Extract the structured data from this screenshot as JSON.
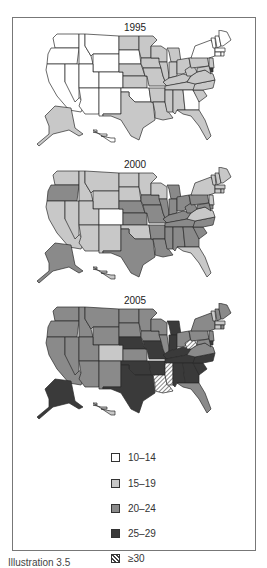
{
  "figure": {
    "caption": "Illustration 3.5"
  },
  "colors": {
    "c10_14": "#ffffff",
    "c15_19": "#c8c8c8",
    "c20_24": "#8a8a8a",
    "c25_29": "#3a3a3a",
    "border": "#2a2a2a"
  },
  "chart_data": {
    "type": "choropleth",
    "title": "",
    "legend_position": "bottom",
    "legend": [
      {
        "label": "10–14",
        "class": "c10_14"
      },
      {
        "label": "15–19",
        "class": "c15_19"
      },
      {
        "label": "20–24",
        "class": "c20_24"
      },
      {
        "label": "25–29",
        "class": "c25_29"
      },
      {
        "label": "≥30",
        "class": "c30"
      }
    ],
    "maps": [
      {
        "year": "1995",
        "states": {
          "WA": "c10_14",
          "OR": "c10_14",
          "CA": "c10_14",
          "NV": "c10_14",
          "ID": "c10_14",
          "MT": "c10_14",
          "WY": "c10_14",
          "UT": "c10_14",
          "CO": "c10_14",
          "AZ": "c10_14",
          "NM": "c10_14",
          "ND": "c15_19",
          "SD": "c10_14",
          "NE": "c15_19",
          "KS": "c15_19",
          "OK": "c10_14",
          "TX": "c15_19",
          "MN": "c15_19",
          "IA": "c15_19",
          "MO": "c15_19",
          "AR": "c15_19",
          "LA": "c15_19",
          "WI": "c15_19",
          "IL": "c15_19",
          "MI": "c15_19",
          "IN": "c15_19",
          "OH": "c15_19",
          "KY": "c15_19",
          "TN": "c15_19",
          "MS": "c15_19",
          "AL": "c15_19",
          "GA": "c10_14",
          "FL": "c15_19",
          "SC": "c15_19",
          "NC": "c15_19",
          "VA": "c15_19",
          "WV": "c15_19",
          "PA": "c15_19",
          "NY": "c10_14",
          "VT": "c10_14",
          "NH": "c10_14",
          "ME": "c10_14",
          "MA": "c10_14",
          "CT": "c10_14",
          "RI": "c10_14",
          "NJ": "c15_19",
          "DE": "c25_29",
          "MD": "c15_19",
          "AK": "c15_19",
          "HI": "c10_14"
        }
      },
      {
        "year": "2000",
        "states": {
          "WA": "c15_19",
          "OR": "c20_24",
          "CA": "c15_19",
          "NV": "c15_19",
          "ID": "c15_19",
          "MT": "c15_19",
          "WY": "c15_19",
          "UT": "c15_19",
          "CO": "c10_14",
          "AZ": "c15_19",
          "NM": "c15_19",
          "ND": "c15_19",
          "SD": "c15_19",
          "NE": "c20_24",
          "KS": "c20_24",
          "OK": "c15_19",
          "TX": "c20_24",
          "MN": "c15_19",
          "IA": "c20_24",
          "MO": "c20_24",
          "AR": "c20_24",
          "LA": "c20_24",
          "WI": "c15_19",
          "IL": "c20_24",
          "MI": "c20_24",
          "IN": "c20_24",
          "OH": "c20_24",
          "KY": "c20_24",
          "TN": "c20_24",
          "MS": "c20_24",
          "AL": "c20_24",
          "GA": "c20_24",
          "FL": "c15_19",
          "SC": "c20_24",
          "NC": "c20_24",
          "VA": "c15_19",
          "WV": "c20_24",
          "PA": "c20_24",
          "NY": "c15_19",
          "VT": "c15_19",
          "NH": "c15_19",
          "ME": "c15_19",
          "MA": "c15_19",
          "CT": "c15_19",
          "RI": "c15_19",
          "NJ": "c15_19",
          "DE": "c20_24",
          "MD": "c20_24",
          "AK": "c20_24",
          "HI": "c15_19"
        }
      },
      {
        "year": "2005",
        "states": {
          "WA": "c20_24",
          "OR": "c20_24",
          "CA": "c20_24",
          "NV": "c20_24",
          "ID": "c20_24",
          "MT": "c20_24",
          "WY": "c20_24",
          "UT": "c20_24",
          "CO": "c15_19",
          "AZ": "c20_24",
          "NM": "c20_24",
          "ND": "c20_24",
          "SD": "c20_24",
          "NE": "c25_29",
          "KS": "c20_24",
          "OK": "c25_29",
          "TX": "c25_29",
          "MN": "c20_24",
          "IA": "c20_24",
          "MO": "c25_29",
          "AR": "c25_29",
          "LA": "c30",
          "WI": "c20_24",
          "IL": "c20_24",
          "MI": "c25_29",
          "IN": "c25_29",
          "OH": "c20_24",
          "KY": "c25_29",
          "TN": "c25_29",
          "MS": "c30",
          "AL": "c25_29",
          "GA": "c25_29",
          "FL": "c20_24",
          "SC": "c25_29",
          "NC": "c25_29",
          "VA": "c20_24",
          "WV": "c30",
          "PA": "c20_24",
          "NY": "c20_24",
          "VT": "c15_19",
          "NH": "c20_24",
          "ME": "c20_24",
          "MA": "c15_19",
          "CT": "c15_19",
          "RI": "c20_24",
          "NJ": "c20_24",
          "DE": "c25_29",
          "MD": "c20_24",
          "AK": "c25_29",
          "HI": "c15_19"
        }
      }
    ]
  }
}
